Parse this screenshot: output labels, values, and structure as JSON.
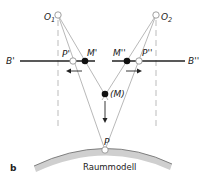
{
  "figure": {
    "panel_label": "b",
    "surface_label": "Raummodell",
    "points": {
      "O1": {
        "label": "O",
        "sub": "1"
      },
      "O2": {
        "label": "O",
        "sub": "2"
      },
      "P_prime": "P'",
      "M_prime": "M'",
      "M_dprime": "M''",
      "P_dprime": "P''",
      "M": "(M)",
      "P": "P"
    },
    "image_planes": {
      "left": "B'",
      "right": "B''"
    },
    "colors": {
      "line": "#222222",
      "ray": "#9a9a9a",
      "dashed": "#aaaaaa",
      "surface": "#cfcfcf"
    }
  }
}
